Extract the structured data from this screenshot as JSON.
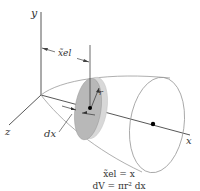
{
  "figure": {
    "type": "centroid of volume of revolution (disk element)",
    "axes": {
      "y_label": "y",
      "x_label": "x",
      "z_label": "z"
    },
    "labels": {
      "xel": "x̃el",
      "r": "r",
      "dx": "dx"
    },
    "equations": {
      "line1": "x̃el = x",
      "line2": "dV = πr² dx"
    },
    "colors": {
      "axis": "#333333",
      "outline": "#9a9a9a",
      "disk_fill": "#b8b8b8",
      "disk_edge": "#d8d8d8",
      "centroid_dot": "#000000"
    }
  }
}
